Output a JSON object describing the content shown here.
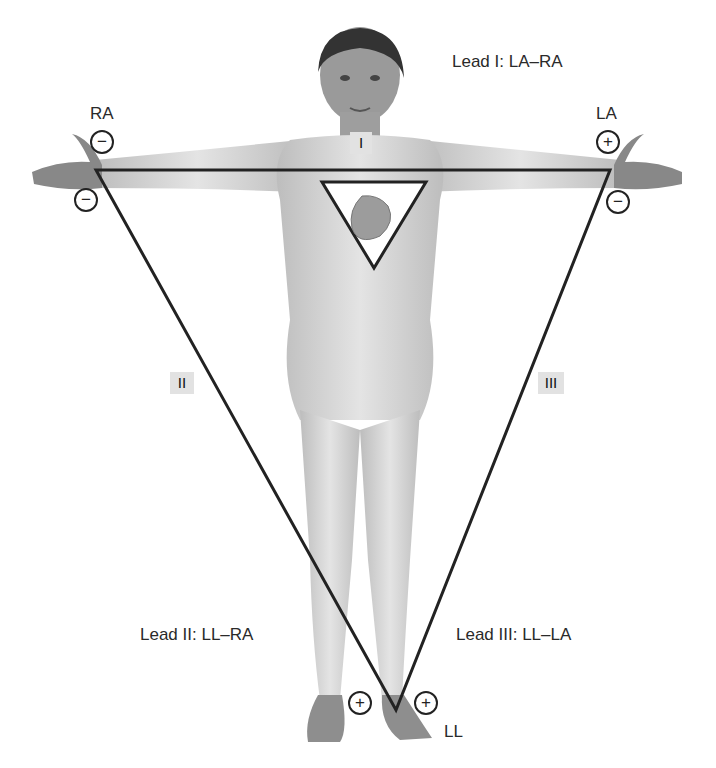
{
  "figure": {
    "leads": [
      {
        "id": "I",
        "roman": "I",
        "formula": "Lead I: LA–RA"
      },
      {
        "id": "II",
        "roman": "II",
        "formula": "Lead II: LL–RA"
      },
      {
        "id": "III",
        "roman": "III",
        "formula": "Lead III: LL–LA"
      }
    ],
    "electrodes": {
      "ra": "RA",
      "la": "LA",
      "ll": "LL"
    },
    "polarity": {
      "ra_lead1": "−",
      "ra_lead2": "−",
      "la_lead1": "+",
      "la_lead3": "−",
      "ll_lead2": "+",
      "ll_lead3": "+"
    },
    "colors": {
      "triangle_line": "#222222",
      "skin": "#d6d6d6",
      "label_box": "#e2e2e2"
    }
  }
}
